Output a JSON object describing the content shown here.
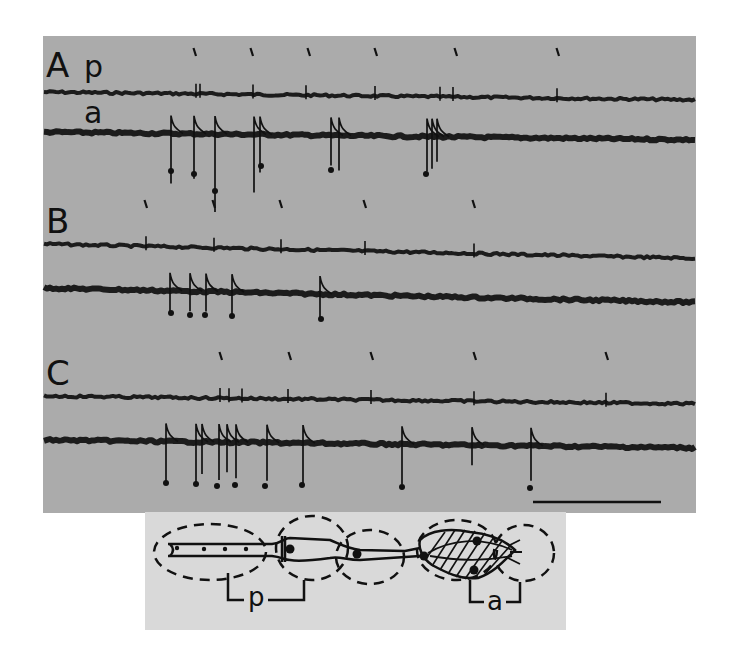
{
  "figure": {
    "panels": [
      {
        "id": "A",
        "label": "A",
        "trace_labels": [
          "p",
          "a"
        ],
        "p_trace_y": 92,
        "a_trace_y": 132,
        "tick_marks_x": [
          195,
          252,
          309,
          376,
          456,
          558
        ],
        "p_spikes_x": [
          196,
          200,
          253,
          306,
          375,
          440,
          453,
          557
        ],
        "a_spikes": [
          {
            "x": 171,
            "depth": 50
          },
          {
            "x": 194,
            "depth": 45
          },
          {
            "x": 215,
            "depth": 78
          },
          {
            "x": 254,
            "depth": 58
          },
          {
            "x": 260,
            "depth": 38
          },
          {
            "x": 331,
            "depth": 30
          },
          {
            "x": 339,
            "depth": 35
          },
          {
            "x": 427,
            "depth": 35
          },
          {
            "x": 432,
            "depth": 32
          },
          {
            "x": 437,
            "depth": 25
          }
        ],
        "dots": [
          {
            "x": 171,
            "y": 171
          },
          {
            "x": 194,
            "y": 174
          },
          {
            "x": 215,
            "y": 191
          },
          {
            "x": 261,
            "y": 166
          },
          {
            "x": 331,
            "y": 170
          },
          {
            "x": 426,
            "y": 174
          }
        ]
      },
      {
        "id": "B",
        "label": "B",
        "trace_labels": [],
        "p_trace_y": 244,
        "a_trace_y": 288,
        "tick_marks_x": [
          146,
          214,
          281,
          365,
          474
        ],
        "p_spikes_x": [
          146,
          214,
          281,
          365,
          474
        ],
        "a_spikes": [
          {
            "x": 170,
            "depth": 22
          },
          {
            "x": 190,
            "depth": 20
          },
          {
            "x": 206,
            "depth": 20
          },
          {
            "x": 232,
            "depth": 22
          },
          {
            "x": 320,
            "depth": 24
          }
        ],
        "dots": [
          {
            "x": 171,
            "y": 313
          },
          {
            "x": 190,
            "y": 315
          },
          {
            "x": 205,
            "y": 315
          },
          {
            "x": 232,
            "y": 316
          },
          {
            "x": 321,
            "y": 319
          }
        ]
      },
      {
        "id": "C",
        "label": "C",
        "trace_labels": [],
        "p_trace_y": 396,
        "a_trace_y": 440,
        "tick_marks_x": [
          221,
          290,
          372,
          475,
          607
        ],
        "p_spikes_x": [
          220,
          229,
          242,
          288,
          371,
          474,
          606
        ],
        "a_spikes": [
          {
            "x": 166,
            "depth": 40
          },
          {
            "x": 196,
            "depth": 42
          },
          {
            "x": 202,
            "depth": 32
          },
          {
            "x": 219,
            "depth": 38
          },
          {
            "x": 227,
            "depth": 30
          },
          {
            "x": 236,
            "depth": 36
          },
          {
            "x": 267,
            "depth": 38
          },
          {
            "x": 303,
            "depth": 40
          },
          {
            "x": 402,
            "depth": 40
          },
          {
            "x": 472,
            "depth": 20
          },
          {
            "x": 531,
            "depth": 35
          }
        ],
        "dots": [
          {
            "x": 166,
            "y": 483
          },
          {
            "x": 196,
            "y": 484
          },
          {
            "x": 217,
            "y": 486
          },
          {
            "x": 235,
            "y": 485
          },
          {
            "x": 265,
            "y": 486
          },
          {
            "x": 302,
            "y": 485
          },
          {
            "x": 402,
            "y": 487
          },
          {
            "x": 530,
            "y": 488
          }
        ]
      }
    ],
    "scale_bar": {
      "x1": 533,
      "x2": 661,
      "y": 502
    },
    "diagram": {
      "region_labels": [
        "p",
        "a"
      ]
    }
  }
}
